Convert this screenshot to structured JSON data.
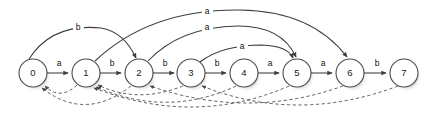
{
  "figure": {
    "name": "suffix-automaton-state-diagram",
    "type": "directed-graph",
    "background_color": "#ffffff",
    "node_stroke_color": "#4a4a4a",
    "solid_edge_color": "#3d3d3d",
    "dashed_edge_color": "#555555",
    "node_radius": 14,
    "baseline_y": 73
  },
  "states": [
    {
      "id": "0",
      "label": "0",
      "cx": 33,
      "cy": 73
    },
    {
      "id": "1",
      "label": "1",
      "cx": 86,
      "cy": 73
    },
    {
      "id": "2",
      "label": "2",
      "cx": 139,
      "cy": 73
    },
    {
      "id": "3",
      "label": "3",
      "cx": 191,
      "cy": 73
    },
    {
      "id": "4",
      "label": "4",
      "cx": 244,
      "cy": 73
    },
    {
      "id": "5",
      "label": "5",
      "cx": 297,
      "cy": 73
    },
    {
      "id": "6",
      "label": "6",
      "cx": 350,
      "cy": 73
    },
    {
      "id": "7",
      "label": "7",
      "cx": 404,
      "cy": 73
    }
  ],
  "transitions": [
    {
      "from": "0",
      "to": "1",
      "label": "a",
      "style": "solid",
      "shape": "straight",
      "label_x": 59,
      "label_y": 64
    },
    {
      "from": "1",
      "to": "2",
      "label": "b",
      "style": "solid",
      "shape": "straight",
      "label_x": 112,
      "label_y": 64
    },
    {
      "from": "2",
      "to": "3",
      "label": "b",
      "style": "solid",
      "shape": "straight",
      "label_x": 165,
      "label_y": 64
    },
    {
      "from": "3",
      "to": "4",
      "label": "b",
      "style": "solid",
      "shape": "straight",
      "label_x": 217,
      "label_y": 64
    },
    {
      "from": "4",
      "to": "5",
      "label": "a",
      "style": "solid",
      "shape": "straight",
      "label_x": 270,
      "label_y": 64
    },
    {
      "from": "5",
      "to": "6",
      "label": "a",
      "style": "solid",
      "shape": "straight",
      "label_x": 323,
      "label_y": 64
    },
    {
      "from": "6",
      "to": "7",
      "label": "b",
      "style": "solid",
      "shape": "straight",
      "label_x": 377,
      "label_y": 64
    },
    {
      "from": "0",
      "to": "2",
      "label": "b",
      "style": "solid",
      "shape": "arc-above",
      "label_x": 78,
      "label_y": 28
    },
    {
      "from": "1",
      "to": "6",
      "label": "a",
      "style": "solid",
      "shape": "arc-above",
      "label_x": 207,
      "label_y": 12
    },
    {
      "from": "2",
      "to": "5",
      "label": "a",
      "style": "solid",
      "shape": "arc-above",
      "label_x": 207,
      "label_y": 28
    },
    {
      "from": "3",
      "to": "5",
      "label": "a",
      "style": "solid",
      "shape": "arc-above",
      "label_x": 242,
      "label_y": 47
    }
  ],
  "suffix_links": [
    {
      "from": "1",
      "to": "0",
      "style": "dashed"
    },
    {
      "from": "2",
      "to": "0",
      "style": "dashed"
    },
    {
      "from": "3",
      "to": "1",
      "style": "dashed"
    },
    {
      "from": "4",
      "to": "1",
      "style": "dashed"
    },
    {
      "from": "5",
      "to": "1",
      "style": "dashed"
    },
    {
      "from": "6",
      "to": "2",
      "style": "dashed"
    },
    {
      "from": "7",
      "to": "3",
      "style": "dashed"
    }
  ],
  "edge_labels": [
    "a",
    "b",
    "b",
    "b",
    "a",
    "a",
    "b",
    "b",
    "a",
    "a",
    "a"
  ],
  "alphabet": [
    "a",
    "b"
  ]
}
